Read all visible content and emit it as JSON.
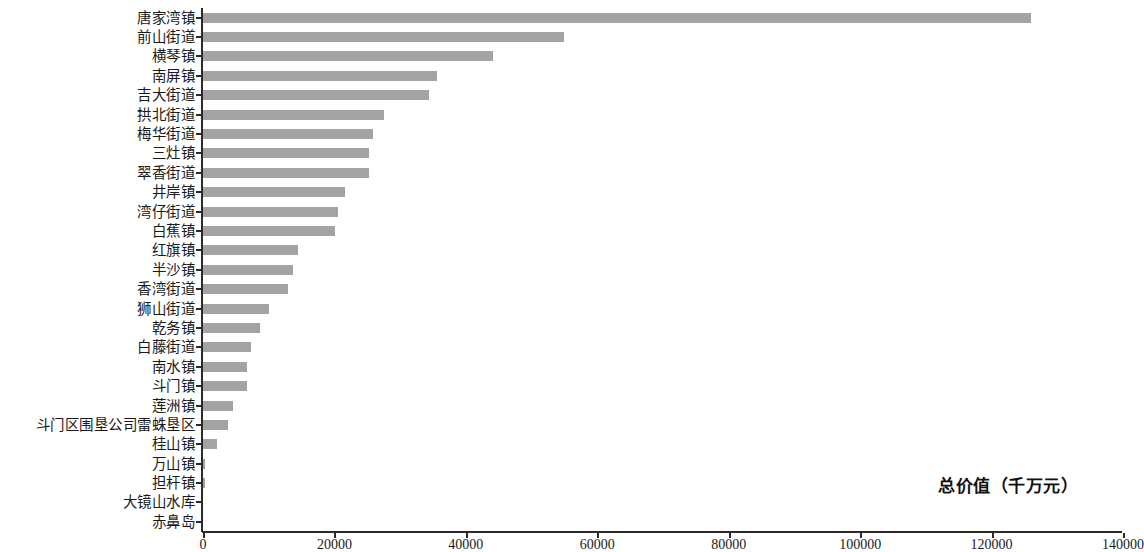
{
  "chart_data": {
    "type": "bar",
    "orientation": "horizontal",
    "title": "",
    "subtitle": "",
    "xlabel": "总价值（千万元）",
    "ylabel": "",
    "xlim": [
      0,
      140000
    ],
    "xticks": [
      0,
      20000,
      40000,
      60000,
      80000,
      100000,
      120000,
      140000
    ],
    "xtick_labels": [
      "0",
      "20000",
      "40000",
      "60000",
      "80000",
      "100000",
      "120000",
      "140000"
    ],
    "grid": false,
    "legend": null,
    "bar_color": "#a3a3a3",
    "axis_color": "#2b2b2b",
    "categories": [
      "唐家湾镇",
      "前山街道",
      "横琴镇",
      "南屏镇",
      "吉大街道",
      "拱北街道",
      "梅华街道",
      "三灶镇",
      "翠香街道",
      "井岸镇",
      "湾仔街道",
      "白蕉镇",
      "红旗镇",
      "半沙镇",
      "香湾街道",
      "狮山街道",
      "乾务镇",
      "白藤街道",
      "南水镇",
      "斗门镇",
      "莲洲镇",
      "斗门区围垦公司雷蛛垦区",
      "桂山镇",
      "万山镇",
      "担杆镇",
      "大镜山水库",
      "赤鼻岛"
    ],
    "values": [
      126000,
      55000,
      44100,
      35600,
      34400,
      27500,
      25900,
      25300,
      25300,
      21600,
      20500,
      20100,
      14500,
      13700,
      12900,
      10000,
      8700,
      7300,
      6700,
      6700,
      4600,
      3800,
      2100,
      300,
      300,
      0,
      0
    ]
  }
}
